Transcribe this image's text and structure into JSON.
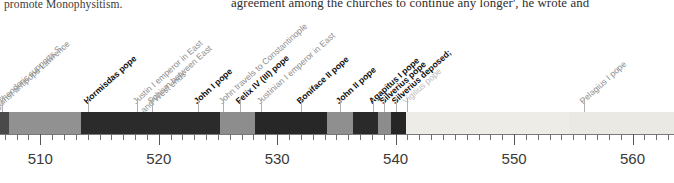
{
  "page": {
    "body_text_left": "promote Monophysitism.",
    "body_text_right": "agreement among the churches to continue any longer', he wrote and"
  },
  "chart_data": {
    "type": "timeline",
    "title": "",
    "xlabel": "",
    "ylabel": "",
    "xlim": [
      506.6,
      563.5
    ],
    "grid": false,
    "legend": "none",
    "axis": {
      "major_ticks": [
        510,
        520,
        530,
        540,
        550,
        560
      ],
      "tick_labels": [
        "510",
        "520",
        "530",
        "540",
        "550",
        "560"
      ],
      "minor_tick_step": 1
    },
    "segments": [
      {
        "name": "pre-511 dark band",
        "start": 506.6,
        "end": 507.4,
        "color": "#4a4a4a"
      },
      {
        "name": "Symmachus pope",
        "start": 507.4,
        "end": 513.4,
        "color": "#919191"
      },
      {
        "name": "Hormisdas pope",
        "start": 513.4,
        "end": 525.2,
        "color": "#2b2b2b"
      },
      {
        "name": "John I pope",
        "start": 525.2,
        "end": 528.1,
        "color": "#8d8d8d"
      },
      {
        "name": "Felix IV (III) pope",
        "start": 528.1,
        "end": 534.2,
        "color": "#272727"
      },
      {
        "name": "Boniface II pope",
        "start": 534.2,
        "end": 536.4,
        "color": "#8f8f8f"
      },
      {
        "name": "John II pope",
        "start": 536.4,
        "end": 538.5,
        "color": "#2a2a2a"
      },
      {
        "name": "Agapitus I pope",
        "start": 538.5,
        "end": 539.6,
        "color": "#8c8c8c"
      },
      {
        "name": "Silverius pope",
        "start": 539.6,
        "end": 540.9,
        "color": "#262626"
      },
      {
        "name": "Vigilius pope",
        "start": 540.9,
        "end": 554.6,
        "color": "#eeece7"
      },
      {
        "name": "Pelagius I pope",
        "start": 554.6,
        "end": 563.5,
        "color": "#ebe9e4"
      }
    ],
    "events": [
      {
        "label": "Theodoric supports S…",
        "sub": "against antipope Lawrence",
        "year": 506.8,
        "style": "plain",
        "rows": 2
      },
      {
        "label": "Hormisdas pope",
        "year": 514.0,
        "style": "bold",
        "rows": 1
      },
      {
        "label": "Justin I emperor in East",
        "year": 518.2,
        "style": "plain",
        "rows": 1
      },
      {
        "label": "Schism between East and West ends",
        "year": 519.4,
        "style": "plain",
        "rows": 2
      },
      {
        "label": "John I pope",
        "year": 523.3,
        "style": "bold",
        "rows": 1
      },
      {
        "label": "John travels to Constantinople",
        "year": 525.4,
        "style": "plain",
        "rows": 1
      },
      {
        "label": "Felix IV (III) pope",
        "year": 526.9,
        "style": "bold",
        "rows": 1
      },
      {
        "label": "Justinian I emperor in East",
        "year": 528.6,
        "style": "plain",
        "rows": 1
      },
      {
        "label": "Boniface II pope",
        "year": 532.0,
        "style": "bold",
        "rows": 1
      },
      {
        "label": "John II pope",
        "year": 535.3,
        "style": "bold",
        "rows": 1
      },
      {
        "label": "Agapitus I pope",
        "year": 538.1,
        "style": "bold",
        "rows": 1
      },
      {
        "label": "Silverius pope",
        "year": 539.0,
        "style": "bold",
        "rows": 1
      },
      {
        "label": "Silverius deposed;",
        "year": 540.0,
        "style": "bold",
        "rows": 1
      },
      {
        "label": "Vigilius pope",
        "year": 541.0,
        "style": "faint",
        "rows": 1
      },
      {
        "label": "Pelagius I pope",
        "year": 555.9,
        "style": "plain",
        "rows": 1
      }
    ]
  }
}
